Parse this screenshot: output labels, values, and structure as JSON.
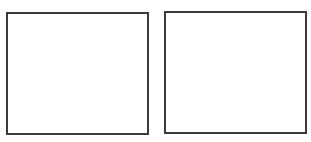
{
  "panels": [
    {
      "id": "left",
      "content": ""
    },
    {
      "id": "right",
      "content": ""
    }
  ],
  "colors": {
    "border": "#3a3a3a",
    "background": "#ffffff"
  }
}
